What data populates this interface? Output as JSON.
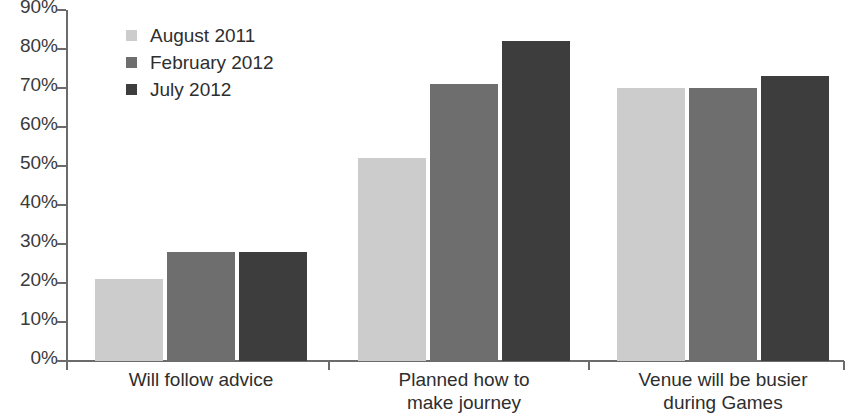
{
  "chart_data": {
    "type": "bar",
    "title": "",
    "xlabel": "",
    "ylabel": "",
    "ylim": [
      0,
      90
    ],
    "grid": false,
    "legend_position": "top-left",
    "categories": [
      "Will follow advice",
      "Planned how to\nmake journey",
      "Venue will be busier\nduring Games"
    ],
    "ytick_labels": [
      "90%",
      "80%",
      "70%",
      "60%",
      "50%",
      "40%",
      "30%",
      "20%",
      "10%",
      "0%"
    ],
    "ytick_values": [
      90,
      80,
      70,
      60,
      50,
      40,
      30,
      20,
      10,
      0
    ],
    "series": [
      {
        "name": "August 2011",
        "color": "#cccccc",
        "values": [
          21,
          52,
          70
        ]
      },
      {
        "name": "February 2012",
        "color": "#6e6e6e",
        "values": [
          28,
          71,
          70
        ]
      },
      {
        "name": "July 2012",
        "color": "#3d3d3d",
        "values": [
          28,
          82,
          73
        ]
      }
    ]
  },
  "legend": {
    "items": [
      {
        "label": "August 2011",
        "color": "#cccccc"
      },
      {
        "label": "February 2012",
        "color": "#6e6e6e"
      },
      {
        "label": "July 2012",
        "color": "#3d3d3d"
      }
    ]
  },
  "axis": {
    "color": "#6b6b6b"
  }
}
